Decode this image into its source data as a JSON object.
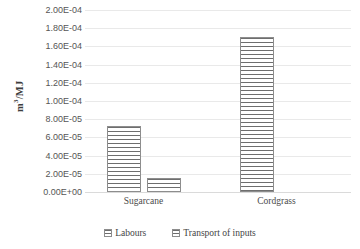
{
  "chart_data": {
    "type": "bar",
    "title": "",
    "xlabel": "",
    "ylabel": "m3/MJ",
    "ylabel_html": "m³/MJ",
    "categories": [
      "Sugarcane",
      "Cordgrass"
    ],
    "series": [
      {
        "name": "Labours",
        "values": [
          7.3e-05,
          0.0001705
        ]
      },
      {
        "name": "Transport of inputs",
        "values": [
          1.55e-05,
          0.0
        ]
      }
    ],
    "ylim": [
      0,
      0.0002
    ],
    "ytick_values": [
      0,
      2e-05,
      4e-05,
      6e-05,
      8e-05,
      0.0001,
      0.00012,
      0.00014,
      0.00016,
      0.00018,
      0.0002
    ],
    "ytick_labels": [
      "0.00E+00",
      "2.00E-05",
      "4.00E-05",
      "6.00E-05",
      "8.00E-05",
      "1.00E-04",
      "1.20E-04",
      "1.40E-04",
      "1.60E-04",
      "1.80E-04",
      "2.00E-04"
    ],
    "grid": {
      "horizontal": true,
      "vertical": false
    },
    "legend": {
      "position": "bottom",
      "entries": [
        "Labours",
        "Transport of inputs"
      ]
    },
    "bar_style": {
      "fill": "#ffffff",
      "hatch": "horizontal-lines",
      "hatch_color": "#6e6e6e",
      "border_color": "#8d8d8d"
    },
    "colors": {
      "background": "#ffffff",
      "gridline": "#e9e9e9",
      "axis_text": "#555555",
      "title_text": "#3d3d3d"
    }
  }
}
